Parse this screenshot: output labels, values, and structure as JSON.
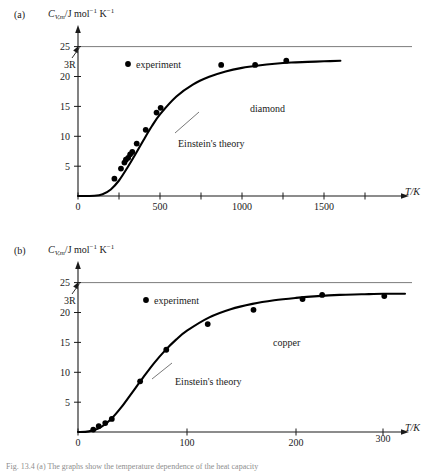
{
  "figure": {
    "caption": "Fig. 13.4  (a) The graphs show the temperature dependence of the heat capacity"
  },
  "panels": [
    {
      "tag": "(a)",
      "material_label": "diamond",
      "legend_label": "experiment",
      "theory_label": "Einstein's theory",
      "limit_label": "3R",
      "y_axis_label_parts": {
        "symbol": "C",
        "subscript": "V,m",
        "units": "/J mol",
        "sup1": "−1",
        "mid": " K",
        "sup2": "−1"
      },
      "x_axis_label": "T/K",
      "y_ticks": [
        "25",
        "20",
        "15",
        "10",
        "5"
      ],
      "x_ticks": [
        "0",
        "500",
        "1000",
        "1500"
      ]
    },
    {
      "tag": "(b)",
      "material_label": "copper",
      "legend_label": "experiment",
      "theory_label": "Einstein's theory",
      "limit_label": "3R",
      "y_axis_label_parts": {
        "symbol": "C",
        "subscript": "V,m",
        "units": "/J mol",
        "sup1": "−1",
        "mid": " K",
        "sup2": "−1"
      },
      "x_axis_label": "T/K",
      "y_ticks": [
        "25",
        "20",
        "15",
        "10",
        "5"
      ],
      "x_ticks": [
        "0",
        "100",
        "200",
        "300"
      ]
    }
  ],
  "chart_data": [
    {
      "type": "scatter",
      "title": "(a) diamond",
      "xlabel": "T/K",
      "ylabel": "C_V,m / J mol^-1 K^-1",
      "xlim": [
        0,
        1600
      ],
      "ylim": [
        0,
        27
      ],
      "xticks": [
        0,
        500,
        1000,
        1500
      ],
      "xticks_minor": [
        250,
        750,
        1250
      ],
      "yticks": [
        5,
        10,
        15,
        20,
        25
      ],
      "grid": false,
      "legend": "experiment",
      "annotations": [
        {
          "text": "3R",
          "value": 24.94,
          "note": "horizontal classical Dulong-Petit limit line at 3R"
        },
        {
          "text": "diamond",
          "x": 1000,
          "y": 17
        },
        {
          "text": "Einstein's theory",
          "x": 620,
          "y": 11.5
        }
      ],
      "series": [
        {
          "name": "experiment",
          "type": "scatter",
          "points": [
            {
              "x": 222,
              "y": 2.9
            },
            {
              "x": 262,
              "y": 4.6
            },
            {
              "x": 283,
              "y": 5.6
            },
            {
              "x": 292,
              "y": 6.1
            },
            {
              "x": 306,
              "y": 6.4
            },
            {
              "x": 318,
              "y": 7.0
            },
            {
              "x": 331,
              "y": 7.4
            },
            {
              "x": 358,
              "y": 8.8
            },
            {
              "x": 413,
              "y": 11.1
            },
            {
              "x": 479,
              "y": 14.0
            },
            {
              "x": 504,
              "y": 14.8
            },
            {
              "x": 873,
              "y": 22.0
            },
            {
              "x": 1080,
              "y": 22.0
            },
            {
              "x": 1270,
              "y": 22.7
            }
          ]
        },
        {
          "name": "Einstein's theory",
          "type": "line",
          "points": [
            {
              "x": 0,
              "y": 0.0
            },
            {
              "x": 100,
              "y": 0.05
            },
            {
              "x": 150,
              "y": 0.3
            },
            {
              "x": 200,
              "y": 1.1
            },
            {
              "x": 250,
              "y": 2.6
            },
            {
              "x": 300,
              "y": 4.7
            },
            {
              "x": 350,
              "y": 7.0
            },
            {
              "x": 400,
              "y": 9.4
            },
            {
              "x": 450,
              "y": 11.7
            },
            {
              "x": 500,
              "y": 13.7
            },
            {
              "x": 600,
              "y": 16.7
            },
            {
              "x": 700,
              "y": 18.7
            },
            {
              "x": 800,
              "y": 20.0
            },
            {
              "x": 900,
              "y": 20.9
            },
            {
              "x": 1000,
              "y": 21.5
            },
            {
              "x": 1100,
              "y": 21.9
            },
            {
              "x": 1200,
              "y": 22.2
            },
            {
              "x": 1300,
              "y": 22.4
            },
            {
              "x": 1400,
              "y": 22.5
            },
            {
              "x": 1500,
              "y": 22.6
            },
            {
              "x": 1600,
              "y": 22.7
            }
          ]
        },
        {
          "name": "3R limit",
          "type": "line",
          "points": [
            {
              "x": 0,
              "y": 24.94
            },
            {
              "x": 1600,
              "y": 24.94
            }
          ]
        }
      ]
    },
    {
      "type": "scatter",
      "title": "(b) copper",
      "xlabel": "T/K",
      "ylabel": "C_V,m / J mol^-1 K^-1",
      "xlim": [
        0,
        320
      ],
      "ylim": [
        0,
        27
      ],
      "xticks": [
        0,
        100,
        200,
        300
      ],
      "xticks_minor": [
        50,
        150,
        250
      ],
      "yticks": [
        5,
        10,
        15,
        20,
        25
      ],
      "grid": false,
      "legend": "experiment",
      "annotations": [
        {
          "text": "3R",
          "value": 24.94,
          "note": "horizontal classical Dulong-Petit limit line at 3R"
        },
        {
          "text": "copper",
          "x": 200,
          "y": 16
        },
        {
          "text": "Einstein's theory",
          "x": 120,
          "y": 9.5
        }
      ],
      "series": [
        {
          "name": "experiment",
          "type": "scatter",
          "points": [
            {
              "x": 14,
              "y": 0.4
            },
            {
              "x": 19,
              "y": 1.0
            },
            {
              "x": 25,
              "y": 1.5
            },
            {
              "x": 31,
              "y": 2.2
            },
            {
              "x": 57,
              "y": 8.5
            },
            {
              "x": 81,
              "y": 13.8
            },
            {
              "x": 119,
              "y": 18.1
            },
            {
              "x": 161,
              "y": 20.5
            },
            {
              "x": 206,
              "y": 22.3
            },
            {
              "x": 224,
              "y": 23.0
            },
            {
              "x": 281,
              "y": 22.8
            }
          ]
        },
        {
          "name": "Einstein's theory",
          "type": "line",
          "points": [
            {
              "x": 0,
              "y": 0.0
            },
            {
              "x": 10,
              "y": 0.1
            },
            {
              "x": 20,
              "y": 0.7
            },
            {
              "x": 30,
              "y": 2.1
            },
            {
              "x": 40,
              "y": 4.2
            },
            {
              "x": 50,
              "y": 6.7
            },
            {
              "x": 60,
              "y": 9.2
            },
            {
              "x": 70,
              "y": 11.6
            },
            {
              "x": 80,
              "y": 13.7
            },
            {
              "x": 90,
              "y": 15.5
            },
            {
              "x": 100,
              "y": 17.0
            },
            {
              "x": 120,
              "y": 19.2
            },
            {
              "x": 140,
              "y": 20.6
            },
            {
              "x": 160,
              "y": 21.5
            },
            {
              "x": 180,
              "y": 22.1
            },
            {
              "x": 200,
              "y": 22.5
            },
            {
              "x": 220,
              "y": 22.8
            },
            {
              "x": 240,
              "y": 23.0
            },
            {
              "x": 260,
              "y": 23.1
            },
            {
              "x": 280,
              "y": 23.2
            },
            {
              "x": 300,
              "y": 23.2
            }
          ]
        },
        {
          "name": "3R limit",
          "type": "line",
          "points": [
            {
              "x": 0,
              "y": 24.94
            },
            {
              "x": 320,
              "y": 24.94
            }
          ]
        }
      ]
    }
  ]
}
